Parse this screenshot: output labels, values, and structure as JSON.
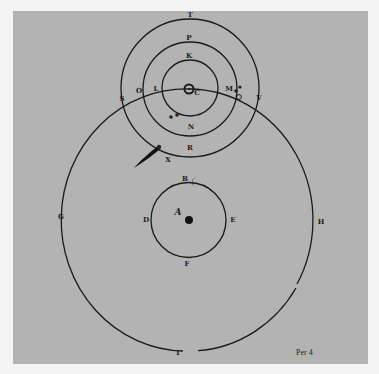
{
  "figure": {
    "background_color": "#b3b3b3",
    "ink_color": "#1a1a1a",
    "caption": "Per 4"
  },
  "sun_system": {
    "center_symbol": "sun-icon",
    "center_label": "C",
    "circles": [
      {
        "name": "inner-orbit",
        "top_label": "K",
        "bottom_label": "N"
      },
      {
        "name": "middle-orbit",
        "top_label": "P",
        "bottom_label": "R"
      },
      {
        "name": "outer-orbit",
        "top_label": "T",
        "bottom_label": ""
      }
    ],
    "orbit_labels": {
      "L": "L",
      "M": "M",
      "O": "O",
      "S": "S",
      "V": "V",
      "X": "X"
    },
    "planet_markers": [
      "venus-mercury-star",
      "mars-star",
      "jupiter-star",
      "saturn-symbol"
    ]
  },
  "earth_system": {
    "center_symbol": "earth-dot",
    "center_label": "A",
    "moon_symbol": "moon-icon",
    "moon_circle_labels": {
      "top": "B",
      "left": "D",
      "right": "E",
      "bottom": "F"
    },
    "great_circle_labels": {
      "left": "G",
      "right": "H",
      "bottom": "I"
    }
  },
  "comet": {
    "symbol": "comet-icon"
  }
}
